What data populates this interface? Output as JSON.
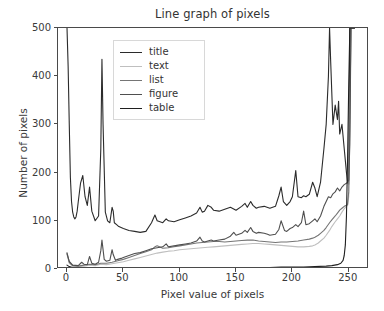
{
  "chart_data": {
    "type": "line",
    "title": "Line graph of pixels",
    "xlabel": "Pixel value of pixels",
    "ylabel": "Number of pixels",
    "xlim": [
      -8,
      268
    ],
    "ylim": [
      0,
      500
    ],
    "xticks": [
      0,
      50,
      100,
      150,
      200,
      250
    ],
    "yticks": [
      0,
      100,
      200,
      300,
      400,
      500
    ],
    "grid": false,
    "legend_position": "upper center",
    "legend_entries": [
      "title",
      "text",
      "list",
      "figure",
      "table"
    ],
    "series": [
      {
        "name": "title",
        "color": "#2b2b2b",
        "x": [
          0,
          1,
          2,
          3,
          4,
          5,
          6,
          7,
          8,
          9,
          10,
          12,
          14,
          16,
          18,
          20,
          22,
          25,
          28,
          30,
          31,
          32,
          34,
          36,
          38,
          40,
          41,
          42,
          44,
          46,
          48,
          50,
          55,
          60,
          65,
          70,
          75,
          78,
          80,
          85,
          88,
          90,
          95,
          100,
          105,
          110,
          115,
          118,
          120,
          122,
          125,
          128,
          130,
          135,
          140,
          145,
          150,
          155,
          158,
          160,
          163,
          165,
          168,
          170,
          175,
          180,
          185,
          188,
          190,
          192,
          195,
          198,
          200,
          203,
          205,
          208,
          210,
          212,
          215,
          218,
          220,
          222,
          225,
          228,
          230,
          232,
          233,
          234,
          236,
          238,
          240,
          241,
          242,
          244,
          246,
          248,
          249,
          250,
          251,
          252,
          253,
          255
        ],
        "y": [
          500,
          420,
          300,
          190,
          140,
          118,
          108,
          104,
          108,
          120,
          140,
          178,
          194,
          150,
          132,
          170,
          120,
          100,
          110,
          250,
          435,
          300,
          118,
          100,
          96,
          128,
          120,
          96,
          92,
          88,
          86,
          84,
          80,
          78,
          76,
          78,
          96,
          112,
          100,
          96,
          104,
          100,
          98,
          102,
          106,
          110,
          116,
          128,
          118,
          120,
          132,
          128,
          122,
          120,
          124,
          128,
          122,
          130,
          136,
          128,
          140,
          132,
          126,
          128,
          130,
          126,
          130,
          152,
          170,
          140,
          132,
          140,
          150,
          204,
          150,
          148,
          152,
          150,
          155,
          180,
          168,
          150,
          180,
          250,
          300,
          400,
          500,
          430,
          300,
          340,
          310,
          348,
          280,
          300,
          250,
          200,
          180,
          176,
          500,
          500,
          500,
          500
        ]
      },
      {
        "name": "text",
        "color": "#bfbfbf",
        "x": [
          0,
          2,
          5,
          10,
          15,
          20,
          25,
          30,
          35,
          40,
          45,
          50,
          55,
          60,
          65,
          70,
          75,
          80,
          85,
          90,
          95,
          100,
          105,
          110,
          115,
          120,
          125,
          130,
          135,
          140,
          145,
          150,
          155,
          160,
          165,
          170,
          175,
          180,
          185,
          190,
          195,
          200,
          205,
          210,
          215,
          218,
          220,
          223,
          225,
          228,
          230,
          233,
          235,
          238,
          240,
          242,
          244,
          246,
          248,
          249,
          250,
          251,
          252,
          255
        ],
        "y": [
          30,
          12,
          6,
          5,
          6,
          8,
          7,
          10,
          9,
          11,
          13,
          15,
          18,
          21,
          24,
          27,
          30,
          33,
          35,
          37,
          38,
          40,
          41,
          42,
          43,
          44,
          45,
          46,
          47,
          48,
          49,
          50,
          51,
          52,
          53,
          53,
          52,
          51,
          50,
          49,
          48,
          47,
          46,
          46,
          47,
          48,
          50,
          54,
          58,
          64,
          70,
          80,
          88,
          98,
          104,
          110,
          118,
          125,
          130,
          132,
          150,
          300,
          500,
          500
        ]
      },
      {
        "name": "list",
        "color": "#757575",
        "x": [
          0,
          2,
          5,
          10,
          15,
          20,
          25,
          30,
          35,
          40,
          45,
          50,
          55,
          60,
          65,
          70,
          75,
          78,
          80,
          82,
          85,
          90,
          95,
          100,
          105,
          110,
          115,
          120,
          125,
          130,
          135,
          140,
          145,
          150,
          155,
          160,
          165,
          170,
          175,
          180,
          185,
          190,
          195,
          200,
          205,
          210,
          215,
          218,
          220,
          223,
          225,
          228,
          230,
          233,
          235,
          238,
          240,
          242,
          244,
          246,
          248,
          249,
          250,
          251,
          252,
          255
        ],
        "y": [
          34,
          14,
          7,
          6,
          8,
          10,
          9,
          12,
          12,
          14,
          17,
          20,
          24,
          28,
          32,
          36,
          40,
          46,
          48,
          46,
          43,
          44,
          46,
          48,
          50,
          52,
          54,
          55,
          56,
          57,
          57,
          56,
          57,
          58,
          59,
          60,
          60,
          58,
          57,
          56,
          55,
          56,
          56,
          57,
          58,
          60,
          62,
          64,
          66,
          70,
          74,
          80,
          86,
          96,
          102,
          110,
          116,
          122,
          126,
          130,
          132,
          134,
          160,
          320,
          500,
          500
        ]
      },
      {
        "name": "figure",
        "color": "#4f4f4f",
        "x": [
          0,
          2,
          5,
          10,
          13,
          15,
          18,
          20,
          22,
          25,
          28,
          30,
          31,
          33,
          35,
          38,
          40,
          41,
          43,
          45,
          48,
          50,
          55,
          60,
          65,
          70,
          75,
          80,
          85,
          88,
          90,
          95,
          100,
          105,
          110,
          115,
          118,
          120,
          122,
          125,
          128,
          130,
          135,
          140,
          145,
          148,
          150,
          155,
          158,
          160,
          163,
          165,
          168,
          170,
          175,
          178,
          180,
          185,
          188,
          190,
          193,
          195,
          198,
          200,
          203,
          205,
          208,
          210,
          212,
          215,
          218,
          220,
          222,
          225,
          228,
          230,
          232,
          234,
          236,
          238,
          240,
          242,
          244,
          246,
          248,
          249,
          250,
          251,
          252,
          255
        ],
        "y": [
          32,
          16,
          8,
          7,
          14,
          10,
          9,
          26,
          12,
          10,
          14,
          38,
          60,
          20,
          16,
          18,
          40,
          30,
          18,
          20,
          22,
          24,
          28,
          32,
          34,
          38,
          42,
          44,
          46,
          52,
          46,
          48,
          50,
          52,
          54,
          58,
          66,
          58,
          56,
          58,
          60,
          58,
          60,
          62,
          68,
          76,
          70,
          74,
          80,
          76,
          86,
          78,
          74,
          76,
          74,
          72,
          70,
          72,
          82,
          100,
          80,
          78,
          84,
          86,
          92,
          88,
          96,
          120,
          92,
          94,
          100,
          104,
          98,
          110,
          130,
          140,
          150,
          148,
          156,
          160,
          168,
          162,
          170,
          175,
          178,
          180,
          184,
          260,
          500,
          500
        ]
      },
      {
        "name": "table",
        "color": "#1f1f1f",
        "x": [
          0,
          2,
          5,
          10,
          20,
          30,
          40,
          50,
          60,
          70,
          80,
          90,
          100,
          110,
          120,
          130,
          140,
          150,
          160,
          170,
          180,
          190,
          200,
          210,
          220,
          230,
          235,
          240,
          243,
          245,
          246,
          247,
          248,
          249,
          250,
          251,
          252,
          255
        ],
        "y": [
          8,
          5,
          3,
          2,
          2,
          2,
          2,
          2,
          2,
          2,
          2,
          2,
          2,
          3,
          3,
          3,
          3,
          3,
          3,
          3,
          3,
          4,
          4,
          4,
          5,
          6,
          7,
          9,
          12,
          18,
          28,
          50,
          110,
          230,
          380,
          500,
          500,
          500
        ]
      }
    ]
  },
  "axes": {
    "xtick_labels": [
      "0",
      "50",
      "100",
      "150",
      "200",
      "250"
    ],
    "ytick_labels": [
      "0",
      "100",
      "200",
      "300",
      "400",
      "500"
    ]
  }
}
